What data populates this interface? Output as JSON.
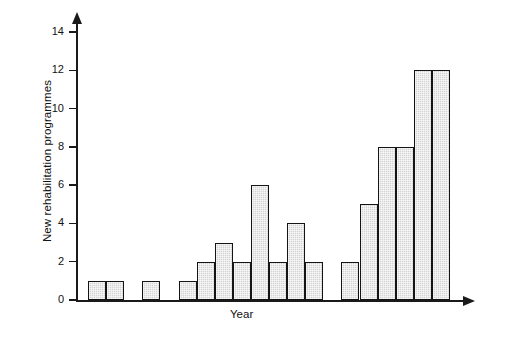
{
  "chart_data": {
    "type": "bar",
    "title": "",
    "subtitle": "",
    "xlabel": "Year",
    "ylabel": "New rehabilitation programmes",
    "ylim": [
      0,
      14
    ],
    "ytick_labels": [
      "0",
      "2",
      "4",
      "6",
      "8",
      "10",
      "12",
      "14"
    ],
    "ytick_values": [
      0,
      2,
      4,
      6,
      8,
      10,
      12,
      14
    ],
    "xtick_labels": [],
    "grid": false,
    "legend": null,
    "categories": [
      "1",
      "2",
      "3",
      "4",
      "5",
      "6",
      "7",
      "8",
      "9",
      "10",
      "11",
      "12",
      "13",
      "14",
      "15",
      "16",
      "17",
      "18",
      "19",
      "20"
    ],
    "values": [
      1,
      1,
      0,
      1,
      0,
      1,
      2,
      3,
      2,
      6,
      2,
      4,
      2,
      0,
      2,
      5,
      8,
      8,
      12,
      12
    ],
    "annotations": [],
    "bar_fill_color": "#d4d4d4",
    "bar_edge_color": "#141414",
    "axis_color": "#1a1a1a",
    "background_color": "#ffffff"
  },
  "axes": {
    "y_title": "New rehabilitation programmes",
    "x_title": "Year"
  }
}
